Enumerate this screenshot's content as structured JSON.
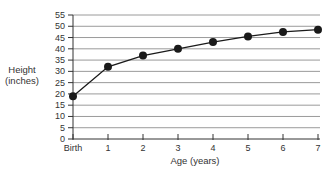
{
  "chart_data": {
    "type": "line",
    "title": "",
    "xlabel": "Age (years)",
    "ylabel": "Height (inches)",
    "ylabel_lines": [
      "Height",
      "(inches)"
    ],
    "categories": [
      "Birth",
      "1",
      "2",
      "3",
      "4",
      "5",
      "6",
      "7"
    ],
    "series": [
      {
        "name": "Height",
        "values": [
          19,
          32,
          37,
          40,
          43,
          45.5,
          47.5,
          48.5
        ]
      }
    ],
    "yticks": [
      0,
      5,
      10,
      15,
      20,
      25,
      30,
      35,
      40,
      45,
      50,
      55
    ],
    "ylim": [
      0,
      55
    ],
    "grid": true,
    "legend": null,
    "colors": {
      "line": "#1a1a1a",
      "marker": "#1a1a1a",
      "grid": "#9a9a9a",
      "axis": "#333333"
    }
  }
}
